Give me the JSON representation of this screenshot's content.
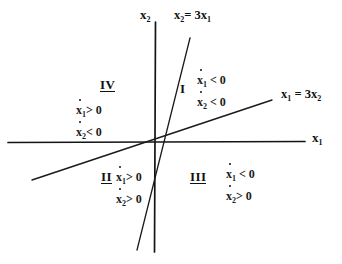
{
  "figure": {
    "type": "phase-plane-region-diagram",
    "background_color": "#ffffff",
    "ink_color": "#111111",
    "width": 342,
    "height": 264
  },
  "axes": {
    "horizontal": {
      "label": "x",
      "subscript": "1",
      "x_start": 8,
      "x_end": 305,
      "y": 142
    },
    "vertical": {
      "label": "x",
      "subscript": "2",
      "x": 155,
      "y_start": 22,
      "y_end": 252
    },
    "origin": {
      "x": 155,
      "y": 142
    }
  },
  "lines": [
    {
      "name": "steep-switching-line",
      "label_lhs": "x",
      "label_lhs_sub": "2",
      "label_rel": "=",
      "label_coef": "3x",
      "label_rhs_sub": "1",
      "label_full": "x2 = 3x1",
      "slope_description": "steep positive",
      "x1": 190,
      "y1": 38,
      "x2": 137,
      "y2": 250
    },
    {
      "name": "shallow-switching-line",
      "label_lhs": "x",
      "label_lhs_sub": "1",
      "label_rel": "=",
      "label_coef": "3x",
      "label_rhs_sub": "2",
      "label_full": "x1 = 3x2",
      "slope_description": "shallow positive",
      "x1": 32,
      "y1": 180,
      "x2": 272,
      "y2": 100
    }
  ],
  "regions": [
    {
      "id": "region-1",
      "numeral": "I",
      "underlined": false,
      "conditions": [
        {
          "var": "x",
          "sub": "1",
          "dot": true,
          "relation": "< 0"
        },
        {
          "var": "x",
          "sub": "2",
          "dot": true,
          "relation": "< 0"
        }
      ]
    },
    {
      "id": "region-2",
      "numeral": "II",
      "underlined": true,
      "conditions": [
        {
          "var": "x",
          "sub": "1",
          "dot": true,
          "relation": "> 0"
        },
        {
          "var": "x",
          "sub": "2",
          "dot": true,
          "relation": "> 0"
        }
      ]
    },
    {
      "id": "region-3",
      "numeral": "III",
      "underlined": true,
      "conditions": [
        {
          "var": "x",
          "sub": "1",
          "dot": true,
          "relation": "< 0"
        },
        {
          "var": "x",
          "sub": "2",
          "dot": true,
          "relation": "> 0"
        }
      ]
    },
    {
      "id": "region-4",
      "numeral": "IV",
      "underlined": true,
      "conditions": [
        {
          "var": "x",
          "sub": "1",
          "dot": true,
          "relation": "> 0"
        },
        {
          "var": "x",
          "sub": "2",
          "dot": true,
          "relation": "< 0"
        }
      ]
    }
  ]
}
